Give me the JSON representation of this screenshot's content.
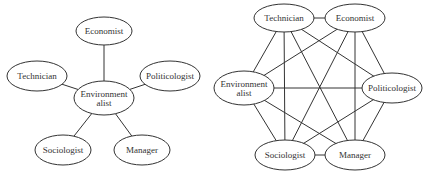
{
  "diagrams": [
    {
      "name": "star-network",
      "nodes": [
        {
          "id": "economist",
          "label": [
            "Economist"
          ],
          "cx": 104,
          "cy": 31,
          "rx": 28,
          "ry": 14
        },
        {
          "id": "technician",
          "label": [
            "Technician"
          ],
          "cx": 37,
          "cy": 76,
          "rx": 30,
          "ry": 15
        },
        {
          "id": "politicologist",
          "label": [
            "Politicologist"
          ],
          "cx": 170,
          "cy": 76,
          "rx": 30,
          "ry": 15
        },
        {
          "id": "environmentalist",
          "label": [
            "Environment",
            "alist"
          ],
          "cx": 104,
          "cy": 98,
          "rx": 30,
          "ry": 17
        },
        {
          "id": "sociologist",
          "label": [
            "Sociologist"
          ],
          "cx": 63,
          "cy": 150,
          "rx": 28,
          "ry": 15
        },
        {
          "id": "manager",
          "label": [
            "Manager"
          ],
          "cx": 142,
          "cy": 150,
          "rx": 28,
          "ry": 15
        }
      ],
      "edges": [
        [
          "environmentalist",
          "economist"
        ],
        [
          "environmentalist",
          "technician"
        ],
        [
          "environmentalist",
          "politicologist"
        ],
        [
          "environmentalist",
          "sociologist"
        ],
        [
          "environmentalist",
          "manager"
        ]
      ]
    },
    {
      "name": "complete-network",
      "nodes": [
        {
          "id": "technician",
          "label": [
            "Technician"
          ],
          "cx": 284,
          "cy": 18,
          "rx": 30,
          "ry": 14
        },
        {
          "id": "economist",
          "label": [
            "Economist"
          ],
          "cx": 355,
          "cy": 18,
          "rx": 30,
          "ry": 14
        },
        {
          "id": "environmentalist",
          "label": [
            "Environment",
            "alist"
          ],
          "cx": 244,
          "cy": 88,
          "rx": 30,
          "ry": 17
        },
        {
          "id": "politicologist",
          "label": [
            "Politicologist"
          ],
          "cx": 392,
          "cy": 88,
          "rx": 30,
          "ry": 15
        },
        {
          "id": "sociologist",
          "label": [
            "Sociologist"
          ],
          "cx": 285,
          "cy": 155,
          "rx": 30,
          "ry": 15
        },
        {
          "id": "manager",
          "label": [
            "Manager"
          ],
          "cx": 355,
          "cy": 155,
          "rx": 30,
          "ry": 15
        }
      ],
      "edges": [
        [
          "technician",
          "economist"
        ],
        [
          "technician",
          "environmentalist"
        ],
        [
          "technician",
          "politicologist"
        ],
        [
          "technician",
          "sociologist"
        ],
        [
          "technician",
          "manager"
        ],
        [
          "economist",
          "environmentalist"
        ],
        [
          "economist",
          "politicologist"
        ],
        [
          "economist",
          "sociologist"
        ],
        [
          "economist",
          "manager"
        ],
        [
          "environmentalist",
          "politicologist"
        ],
        [
          "environmentalist",
          "sociologist"
        ],
        [
          "environmentalist",
          "manager"
        ],
        [
          "politicologist",
          "sociologist"
        ],
        [
          "politicologist",
          "manager"
        ],
        [
          "sociologist",
          "manager"
        ]
      ]
    }
  ]
}
